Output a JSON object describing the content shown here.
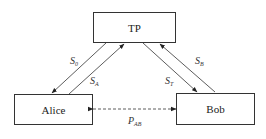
{
  "diagram": {
    "nodes": {
      "tp": {
        "label": "TP"
      },
      "alice": {
        "label": "Alice"
      },
      "bob": {
        "label": "Bob"
      }
    },
    "edges": {
      "s0": {
        "main": "S",
        "sub": "0",
        "from": "TP",
        "to": "Alice"
      },
      "sa": {
        "main": "S",
        "sub": "A",
        "from": "Alice",
        "to": "TP"
      },
      "st": {
        "main": "S",
        "sub": "T",
        "from": "TP",
        "to": "Bob"
      },
      "sb": {
        "main": "S",
        "sub": "B",
        "from": "Bob",
        "to": "TP"
      },
      "pab": {
        "main": "P",
        "sub": "AB",
        "from": "Alice",
        "to": "Bob",
        "style": "dashed",
        "bidirectional": true
      }
    },
    "colors": {
      "stroke": "#333333",
      "background": "#ffffff"
    }
  }
}
